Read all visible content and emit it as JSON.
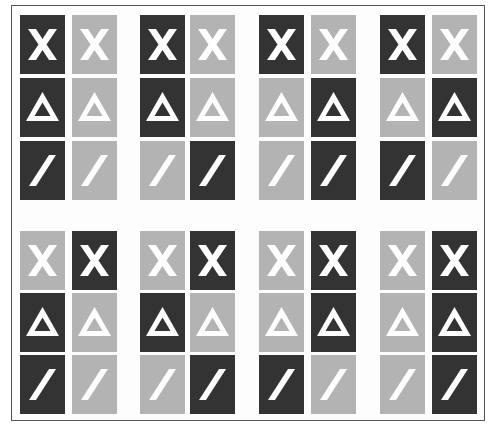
{
  "figure": {
    "colors": {
      "dark": "#333333",
      "light": "#b3b3b3",
      "symbol": "#ffffff",
      "border": "#555555"
    },
    "symbols": [
      "X",
      "Δ",
      "/"
    ],
    "groups": [
      {
        "id": 1,
        "half": "top",
        "rows": [
          [
            "dark",
            "light"
          ],
          [
            "dark",
            "light"
          ],
          [
            "dark",
            "light"
          ]
        ]
      },
      {
        "id": 2,
        "half": "top",
        "rows": [
          [
            "dark",
            "light"
          ],
          [
            "dark",
            "light"
          ],
          [
            "light",
            "dark"
          ]
        ]
      },
      {
        "id": 3,
        "half": "top",
        "rows": [
          [
            "dark",
            "light"
          ],
          [
            "light",
            "dark"
          ],
          [
            "light",
            "dark"
          ]
        ]
      },
      {
        "id": 4,
        "half": "top",
        "rows": [
          [
            "dark",
            "light"
          ],
          [
            "light",
            "dark"
          ],
          [
            "dark",
            "light"
          ]
        ]
      },
      {
        "id": 5,
        "half": "bottom",
        "rows": [
          [
            "light",
            "dark"
          ],
          [
            "dark",
            "light"
          ],
          [
            "dark",
            "light"
          ]
        ]
      },
      {
        "id": 6,
        "half": "bottom",
        "rows": [
          [
            "light",
            "dark"
          ],
          [
            "dark",
            "light"
          ],
          [
            "light",
            "dark"
          ]
        ]
      },
      {
        "id": 7,
        "half": "bottom",
        "rows": [
          [
            "light",
            "dark"
          ],
          [
            "light",
            "dark"
          ],
          [
            "dark",
            "light"
          ]
        ]
      },
      {
        "id": 8,
        "half": "bottom",
        "rows": [
          [
            "light",
            "dark"
          ],
          [
            "light",
            "dark"
          ],
          [
            "light",
            "dark"
          ]
        ]
      }
    ]
  }
}
